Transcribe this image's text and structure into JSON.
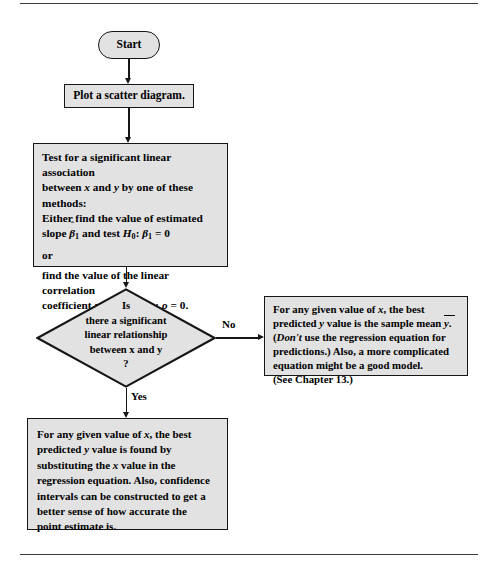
{
  "figure": {
    "type": "flowchart",
    "node_fill_color": "#e2e2e2",
    "node_border_color": "#161616",
    "page_background": "#ffffff"
  },
  "nodes": {
    "start": {
      "shape": "terminator",
      "label": "Start"
    },
    "scatter": {
      "shape": "process",
      "label": "Plot a scatter diagram."
    },
    "test": {
      "shape": "process",
      "line1": "Test for a significant linear association",
      "line2_a": "between ",
      "line2_x": "x",
      "line2_b": " and ",
      "line2_y": "y",
      "line2_c": " by one of these",
      "line3": "methods:",
      "line4": "Either find the value of estimated",
      "line5_a": "slope ",
      "line5_beta_hat": "β",
      "line5_hat": "ˆ",
      "line5_sub1": "1",
      "line5_b": " and test ",
      "line5_H": "H",
      "line5_sub0": "0",
      "line5_c": ": ",
      "line5_beta": "β",
      "line5_sub1b": "1",
      "line5_d": " = 0",
      "line6": "or",
      "line7": "find the value of the linear correlation",
      "line8_a": "coefficient ",
      "line8_r": "r",
      "line8_b": " and test ",
      "line8_H": "H",
      "line8_sub0": "0",
      "line8_c": ": ",
      "line8_rho": "ρ",
      "line8_d": " = 0."
    },
    "decision": {
      "shape": "diamond",
      "label": "Is\nthere a significant\nlinear relationship\nbetween x and y\n?"
    },
    "no_result": {
      "shape": "process",
      "line1_a": "For any given value of ",
      "line1_x": "x",
      "line1_b": ", the best",
      "line2_a": "predicted ",
      "line2_y": "y",
      "line2_b": " value is the sample mean ",
      "line2_ybar": "y",
      "line2_c": ".",
      "line3_a": "(",
      "line3_dont": "Don't",
      "line3_b": " use the regression equation for",
      "line4": "predictions.) Also, a more complicated",
      "line5": "equation might be a good model.",
      "line6": "(See Chapter 13.)"
    },
    "yes_result": {
      "shape": "process",
      "line1_a": "For any given value of ",
      "line1_x": "x",
      "line1_b": ", the best",
      "line2_a": "predicted ",
      "line2_y": "y",
      "line2_b": " value is found by",
      "line3_a": "substituting the ",
      "line3_x": "x",
      "line3_b": " value in the",
      "line4": "regression equation. Also, confidence",
      "line5": "intervals can be constructed to get a",
      "line6": "better sense of how accurate the",
      "line7": "point estimate is."
    }
  },
  "branches": {
    "no_label": "No",
    "yes_label": "Yes"
  }
}
